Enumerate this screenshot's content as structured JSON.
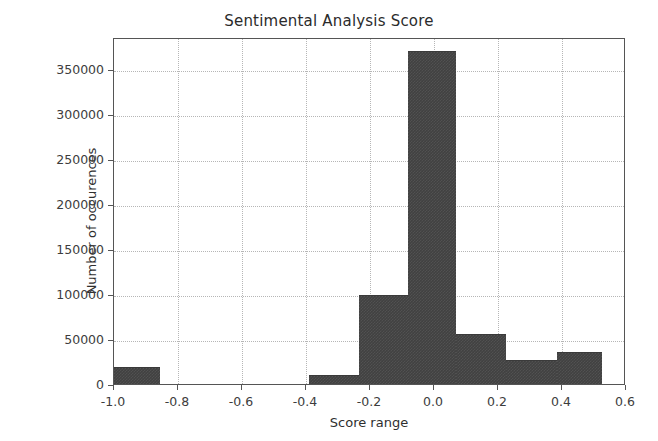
{
  "chart_data": {
    "type": "bar",
    "title": "Sentimental Analysis Score",
    "xlabel": "Score range",
    "ylabel": "Number of occurences",
    "xlim": [
      -1.0,
      0.6
    ],
    "ylim": [
      0,
      385000
    ],
    "grid": true,
    "legend": null,
    "xticks": [
      -1.0,
      -0.8,
      -0.6,
      -0.4,
      -0.2,
      0.0,
      0.2,
      0.4,
      0.6
    ],
    "xtick_labels": [
      "-1.0",
      "-0.8",
      "-0.6",
      "-0.4",
      "-0.2",
      "0.0",
      "0.2",
      "0.4",
      "0.6"
    ],
    "yticks": [
      0,
      50000,
      100000,
      150000,
      200000,
      250000,
      300000,
      350000
    ],
    "ytick_labels": [
      "0",
      "50000",
      "100000",
      "150000",
      "200000",
      "250000",
      "300000",
      "350000"
    ],
    "bar_color": "#414141",
    "bins": [
      {
        "x0": -1.0,
        "x1": -0.855,
        "value": 19000
      },
      {
        "x0": -0.855,
        "x1": -0.39,
        "value": 0
      },
      {
        "x0": -0.39,
        "x1": -0.235,
        "value": 10000
      },
      {
        "x0": -0.235,
        "x1": -0.08,
        "value": 99000
      },
      {
        "x0": -0.08,
        "x1": 0.07,
        "value": 370000
      },
      {
        "x0": 0.07,
        "x1": 0.225,
        "value": 55000
      },
      {
        "x0": 0.225,
        "x1": 0.385,
        "value": 27000
      },
      {
        "x0": 0.385,
        "x1": 0.525,
        "value": 36000
      }
    ],
    "categories": [
      "-1.0 to -0.855",
      "-0.855 to -0.39",
      "-0.39 to -0.235",
      "-0.235 to -0.08",
      "-0.08 to 0.07",
      "0.07 to 0.225",
      "0.225 to 0.385",
      "0.385 to 0.525"
    ],
    "values": [
      19000,
      0,
      10000,
      99000,
      370000,
      55000,
      27000,
      36000
    ]
  }
}
